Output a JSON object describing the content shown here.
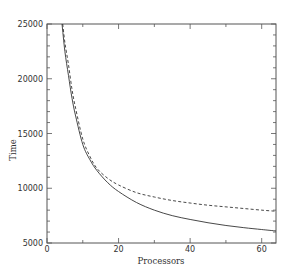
{
  "chart_data": {
    "type": "line",
    "title": "",
    "xlabel": "Processors",
    "ylabel": "Time",
    "xlim": [
      0,
      64
    ],
    "ylim": [
      5000,
      25000
    ],
    "xticks": [
      0,
      20,
      40,
      60
    ],
    "yticks": [
      5000,
      10000,
      15000,
      20000,
      25000
    ],
    "x_minor_step": 10,
    "y_minor_step": 1000,
    "grid": false,
    "legend": null,
    "series": [
      {
        "name": "solid",
        "style": "solid",
        "color": "#333333",
        "x": [
          4.2,
          5,
          6,
          7,
          8,
          10,
          12,
          14,
          17,
          20,
          25,
          30,
          35,
          40,
          45,
          50,
          55,
          60,
          64
        ],
        "values": [
          25000,
          22500,
          20300,
          18200,
          16600,
          14000,
          12600,
          11600,
          10500,
          9700,
          8700,
          8000,
          7500,
          7150,
          6850,
          6600,
          6400,
          6230,
          6100
        ]
      },
      {
        "name": "dashed",
        "style": "dashed",
        "color": "#333333",
        "x": [
          4.4,
          5,
          6,
          7,
          8,
          10,
          12,
          14,
          17,
          20,
          25,
          30,
          35,
          40,
          45,
          50,
          55,
          60,
          64
        ],
        "values": [
          25000,
          23300,
          21300,
          19000,
          17300,
          14500,
          12900,
          11800,
          10900,
          10300,
          9600,
          9200,
          8880,
          8650,
          8450,
          8300,
          8150,
          8000,
          7900
        ]
      }
    ]
  },
  "axes": {
    "x_tick_labels": [
      "0",
      "20",
      "40",
      "60"
    ],
    "y_tick_labels": [
      "5000",
      "10000",
      "15000",
      "20000",
      "25000"
    ],
    "xlabel": "Processors",
    "ylabel": "Time"
  }
}
